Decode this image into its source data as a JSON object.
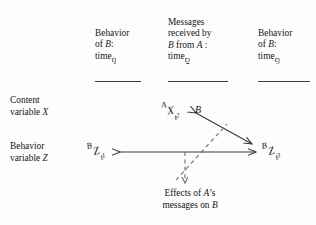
{
  "figure": {
    "type": "process-diagram",
    "background_color": "#fdfdfd",
    "ink_color": "#171717",
    "line_color": "#3a3a3a"
  },
  "columns": [
    {
      "id": "col-t1",
      "line1": "Behavior",
      "line2_prefix": "of ",
      "line2_italic": "B",
      "line2_suffix": ":",
      "line3_word": "time",
      "line3_sub": "t",
      "line3_subsub": "1"
    },
    {
      "id": "col-t2",
      "line0": "Messages",
      "line1": "received by",
      "line2_italic_a": "B",
      "line2_mid": " from ",
      "line2_italic_b": "A",
      "line2_suffix": " :",
      "line3_word": "time",
      "line3_sub": "t",
      "line3_subsub": "2"
    },
    {
      "id": "col-t3",
      "line1": "Behavior",
      "line2_prefix": "of ",
      "line2_italic": "B",
      "line2_suffix": ":",
      "line3_word": "time",
      "line3_sub": "t",
      "line3_subsub": "3"
    }
  ],
  "row_labels": [
    {
      "id": "content-variable",
      "line1": "Content",
      "line2_prefix": "variable ",
      "line2_italic": "X"
    },
    {
      "id": "behavior-variable",
      "line1": "Behavior",
      "line2_prefix": "variable ",
      "line2_italic": "Z"
    }
  ],
  "node_labels": [
    {
      "id": "node-x-t2",
      "presuperscript": "A",
      "base": "X",
      "sub": "t",
      "subsub": "2",
      "trailing": "B"
    },
    {
      "id": "node-z-t1",
      "presuperscript": "B",
      "base": "Z",
      "sub": "t",
      "subsub": "1",
      "trailing": ""
    },
    {
      "id": "node-z-t3",
      "presuperscript": "B",
      "base": "Z",
      "sub": "t",
      "subsub": "3",
      "trailing": ""
    }
  ],
  "caption": {
    "line1_prefix": "Effects of ",
    "line1_italic": "A",
    "line1_suffix": "’s",
    "line2_prefix": "messages on ",
    "line2_italic": "B"
  }
}
